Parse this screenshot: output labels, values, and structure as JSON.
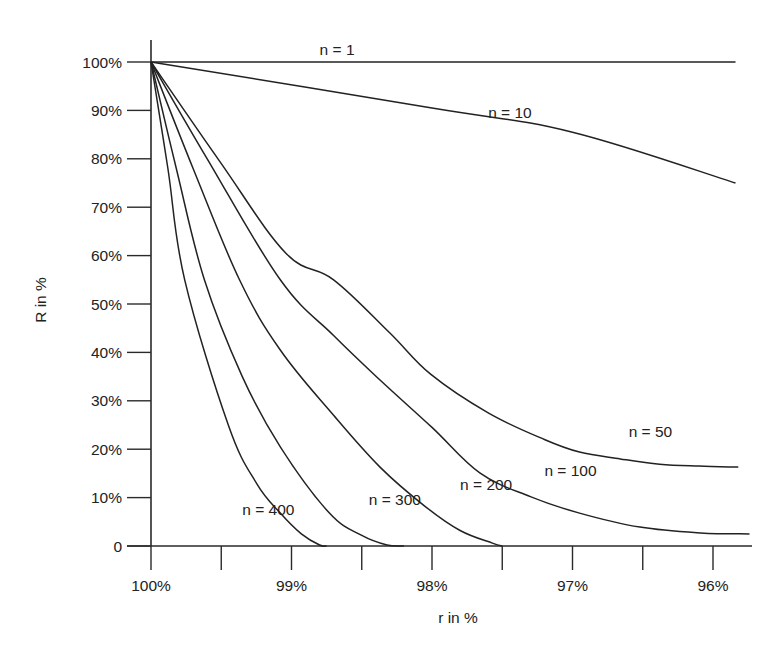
{
  "chart_data": {
    "type": "line",
    "title": "",
    "xlabel": "r in %",
    "ylabel": "R in %",
    "xlim": [
      100,
      95.75
    ],
    "ylim": [
      0,
      100
    ],
    "x_reversed": true,
    "grid": false,
    "legend": "none (inline curve labels)",
    "xticks": [
      {
        "value": 100,
        "label": "100%"
      },
      {
        "value": 99.5,
        "label": ""
      },
      {
        "value": 99,
        "label": "99%"
      },
      {
        "value": 98.5,
        "label": ""
      },
      {
        "value": 98,
        "label": "98%"
      },
      {
        "value": 97.5,
        "label": ""
      },
      {
        "value": 97,
        "label": "97%"
      },
      {
        "value": 96.5,
        "label": ""
      },
      {
        "value": 96,
        "label": "96%"
      }
    ],
    "yticks": [
      {
        "value": 0,
        "label": "0"
      },
      {
        "value": 10,
        "label": "10%"
      },
      {
        "value": 20,
        "label": "20%"
      },
      {
        "value": 30,
        "label": "30%"
      },
      {
        "value": 40,
        "label": "40%"
      },
      {
        "value": 50,
        "label": "50%"
      },
      {
        "value": 60,
        "label": "60%"
      },
      {
        "value": 70,
        "label": "70%"
      },
      {
        "value": 80,
        "label": "80%"
      },
      {
        "value": 90,
        "label": "90%"
      },
      {
        "value": 100,
        "label": "100%"
      }
    ],
    "series": [
      {
        "name": "n = 1",
        "label": "n = 1",
        "label_at": [
          98.8,
          101.5
        ],
        "points": [
          [
            100,
            100
          ],
          [
            95.84,
            100
          ]
        ]
      },
      {
        "name": "n = 10",
        "label": "n = 10",
        "label_at": [
          97.6,
          88.5
        ],
        "points": [
          [
            100,
            100
          ],
          [
            98,
            90.5
          ],
          [
            97,
            85.5
          ],
          [
            95.84,
            75
          ]
        ]
      },
      {
        "name": "n = 50",
        "label": "n = 50",
        "label_at": [
          96.6,
          22.5
        ],
        "points": [
          [
            100,
            100
          ],
          [
            99.5,
            79
          ],
          [
            99.04,
            60.5
          ],
          [
            98.7,
            55
          ],
          [
            98.3,
            44
          ],
          [
            98.01,
            35.5
          ],
          [
            97.6,
            27.5
          ],
          [
            97.2,
            22
          ],
          [
            96.95,
            19.4
          ],
          [
            96.66,
            18
          ],
          [
            96.38,
            16.9
          ],
          [
            96.1,
            16.5
          ],
          [
            95.82,
            16.3
          ]
        ]
      },
      {
        "name": "n = 100",
        "label": "n = 100",
        "label_at": [
          97.2,
          14.5
        ],
        "points": [
          [
            100,
            100
          ],
          [
            99.6,
            80
          ],
          [
            99.08,
            55
          ],
          [
            98.7,
            43.5
          ],
          [
            98.37,
            34.3
          ],
          [
            98.0,
            24.5
          ],
          [
            97.66,
            15.1
          ],
          [
            97.3,
            10.2
          ],
          [
            96.95,
            6.8
          ],
          [
            96.52,
            3.9
          ],
          [
            96.09,
            2.7
          ],
          [
            95.74,
            2.5
          ]
        ]
      },
      {
        "name": "n = 200",
        "label": "n = 200",
        "label_at": [
          97.8,
          11.5
        ],
        "points": [
          [
            100,
            100
          ],
          [
            99.7,
            78
          ],
          [
            99.37,
            55
          ],
          [
            99.08,
            40.5
          ],
          [
            98.7,
            27
          ],
          [
            98.37,
            16.3
          ],
          [
            98.05,
            8.2
          ],
          [
            97.8,
            3.2
          ],
          [
            97.57,
            0.6
          ],
          [
            97.5,
            0
          ]
        ]
      },
      {
        "name": "n = 300",
        "label": "n = 300",
        "label_at": [
          98.45,
          8.5
        ],
        "points": [
          [
            100,
            100
          ],
          [
            99.82,
            78
          ],
          [
            99.62,
            55
          ],
          [
            99.35,
            35
          ],
          [
            99.08,
            20.5
          ],
          [
            98.73,
            6.8
          ],
          [
            98.5,
            2.2
          ],
          [
            98.32,
            0.2
          ],
          [
            98.2,
            0
          ]
        ]
      },
      {
        "name": "n = 400",
        "label": "n = 400",
        "label_at": [
          99.35,
          6.5
        ],
        "points": [
          [
            100,
            100
          ],
          [
            99.88,
            78
          ],
          [
            99.76,
            55
          ],
          [
            99.45,
            25
          ],
          [
            99.25,
            13
          ],
          [
            99.08,
            6.8
          ],
          [
            98.93,
            2.5
          ],
          [
            98.8,
            0.2
          ],
          [
            98.75,
            0
          ]
        ]
      }
    ]
  }
}
